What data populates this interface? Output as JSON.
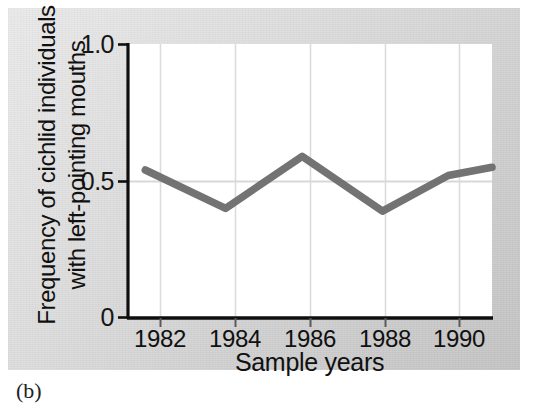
{
  "figure": {
    "caption": "(b)",
    "background_color": "#d3d3d3",
    "plot_background_color": "#ffffff",
    "axis_color": "#101010",
    "line_color": "#6b6b6b",
    "gridline_color": "#dcdcdc"
  },
  "chart_data": {
    "type": "line",
    "title": "",
    "subtitle": "",
    "xlabel": "Sample years",
    "ylabel": "Frequency of cichlid individuals with left-pointing mouths",
    "ylabel_lines": [
      "Frequency of cichlid individuals",
      "with left-pointing mouths"
    ],
    "xlim": [
      1981,
      1991
    ],
    "ylim": [
      0,
      1.0
    ],
    "xticks": [
      1982,
      1984,
      1986,
      1988,
      1990
    ],
    "xtick_labels": [
      "1982",
      "1984",
      "1986",
      "1988",
      "1990"
    ],
    "yticks": [
      0,
      0.5,
      1.0
    ],
    "ytick_labels": [
      "0",
      "0.5",
      "1.0"
    ],
    "grid": "vertical gridlines at each x tick, plus horizontal gridline at y = 0.5",
    "legend": "none",
    "series": [
      {
        "name": "Frequency of left-pointing mouths",
        "x": [
          1981.5,
          1983.7,
          1985.8,
          1988.0,
          1989.8,
          1991.0
        ],
        "values": [
          0.54,
          0.4,
          0.59,
          0.39,
          0.52,
          0.55
        ]
      }
    ]
  }
}
